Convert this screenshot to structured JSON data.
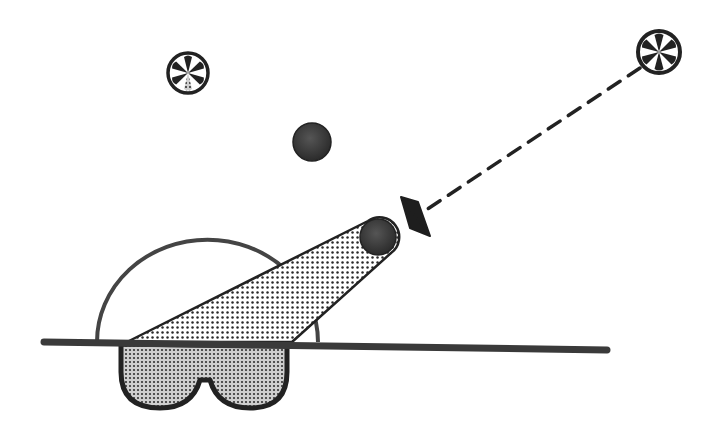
{
  "diagram": {
    "type": "illustration",
    "colors": {
      "background": "#ffffff",
      "stroke": "#2a2a2a",
      "dark_fill": "#3a3a3a",
      "stipple": "#2a2a2a"
    },
    "elements": {
      "source_left": {
        "label": "",
        "cx": 188,
        "cy": 73,
        "r": 21
      },
      "source_right": {
        "label": "",
        "cx": 659,
        "cy": 52,
        "r": 23
      },
      "ball_top": {
        "cx": 312,
        "cy": 142,
        "r": 19
      },
      "ball_cone_tip": {
        "cx": 378,
        "cy": 238,
        "r": 18
      },
      "dashed_ray": {
        "from": [
          640,
          68
        ],
        "to": [
          425,
          212
        ]
      },
      "arrowhead": {
        "tip": [
          398,
          210
        ]
      },
      "ground_line": {
        "from": [
          44,
          342
        ],
        "to": [
          607,
          350
        ]
      },
      "dome": {
        "cx": 205,
        "cy": 342,
        "r": 108
      },
      "base_cup": {
        "x_left": 120,
        "x_right": 288,
        "top": 344,
        "bottom": 410
      }
    }
  }
}
